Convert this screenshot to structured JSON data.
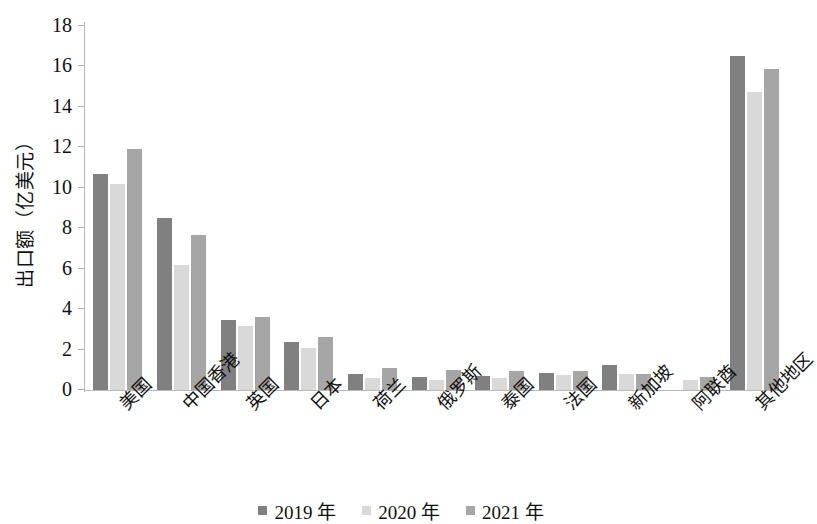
{
  "chart_data": {
    "type": "bar",
    "title": "",
    "subtitle": "",
    "xlabel": "",
    "ylabel": "出口额（亿美元）",
    "ylim": [
      0,
      18
    ],
    "ytick_labels": [
      "18",
      "16",
      "14",
      "12",
      "10",
      "8",
      "6",
      "4",
      "2",
      "0"
    ],
    "ytick_values": [
      18,
      16,
      14,
      12,
      10,
      8,
      6,
      4,
      2,
      0
    ],
    "grid": false,
    "legend_position": "bottom-center",
    "categories": [
      "美国",
      "中国香港",
      "英国",
      "日本",
      "荷兰",
      "俄罗斯",
      "泰国",
      "法国",
      "新加坡",
      "阿联酋",
      "其他地区"
    ],
    "series": [
      {
        "name": "2019 年",
        "color": "#808080",
        "values": [
          10.7,
          8.5,
          3.45,
          2.35,
          0.8,
          0.65,
          0.7,
          0.85,
          1.25,
          0.0,
          16.5
        ]
      },
      {
        "name": "2020 年",
        "color": "#d9d9d9",
        "values": [
          10.2,
          6.2,
          3.15,
          2.1,
          0.6,
          0.5,
          0.6,
          0.75,
          0.8,
          0.5,
          14.75
        ]
      },
      {
        "name": "2021 年",
        "color": "#a6a6a6",
        "values": [
          11.9,
          7.65,
          3.6,
          2.6,
          1.1,
          1.0,
          0.95,
          0.95,
          0.8,
          0.65,
          15.85
        ]
      }
    ]
  },
  "axis": {
    "y_axis_color": "#b9b9b9",
    "x_axis_color": "#b9b9b9"
  }
}
